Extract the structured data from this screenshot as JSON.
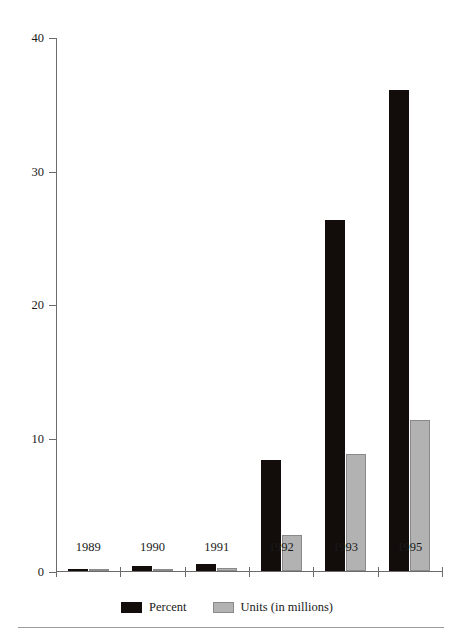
{
  "chart_data": {
    "type": "bar",
    "title": "",
    "xlabel": "",
    "ylabel": "",
    "categories": [
      "1989",
      "1990",
      "1991",
      "1992",
      "1993",
      "1995"
    ],
    "series": [
      {
        "name": "Percent",
        "color": "#120d0b",
        "values": [
          0.1,
          0.4,
          0.5,
          8.3,
          26.3,
          36.0
        ]
      },
      {
        "name": "Units (in millions)",
        "color": "#b2b2b2",
        "values": [
          0.05,
          0.1,
          0.2,
          2.7,
          8.8,
          11.3
        ]
      }
    ],
    "ylim": [
      0,
      40
    ],
    "yticks": [
      0,
      10,
      20,
      30,
      40
    ],
    "ytick_labels": [
      "0",
      "10",
      "20",
      "30",
      "40"
    ],
    "grid": false,
    "legend_position": "bottom"
  },
  "legend": {
    "items": [
      {
        "label": "Percent",
        "swatch": "percent-swatch"
      },
      {
        "label": "Units (in millions)",
        "swatch": "units-swatch"
      }
    ]
  }
}
